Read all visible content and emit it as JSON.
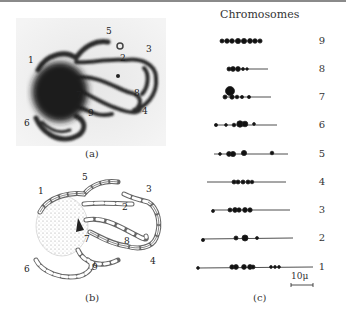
{
  "figure": {
    "panel_a": {
      "caption": "(a)",
      "description": "micrograph of pachytene chromosomes",
      "labels": [
        "1",
        "2",
        "3",
        "4",
        "5",
        "6",
        "7",
        "8",
        "9"
      ]
    },
    "panel_b": {
      "caption": "(b)",
      "description": "drawing of chromosomes from micrograph",
      "labels": [
        "1",
        "2",
        "3",
        "4",
        "5",
        "6",
        "7",
        "8",
        "9"
      ]
    },
    "panel_c": {
      "caption": "(c)",
      "title": "Chromosomes",
      "scale_bar": "10μ",
      "chromosomes": [
        {
          "label": "9"
        },
        {
          "label": "8"
        },
        {
          "label": "7"
        },
        {
          "label": "6"
        },
        {
          "label": "5"
        },
        {
          "label": "4"
        },
        {
          "label": "3"
        },
        {
          "label": "2"
        },
        {
          "label": "1"
        }
      ]
    }
  }
}
